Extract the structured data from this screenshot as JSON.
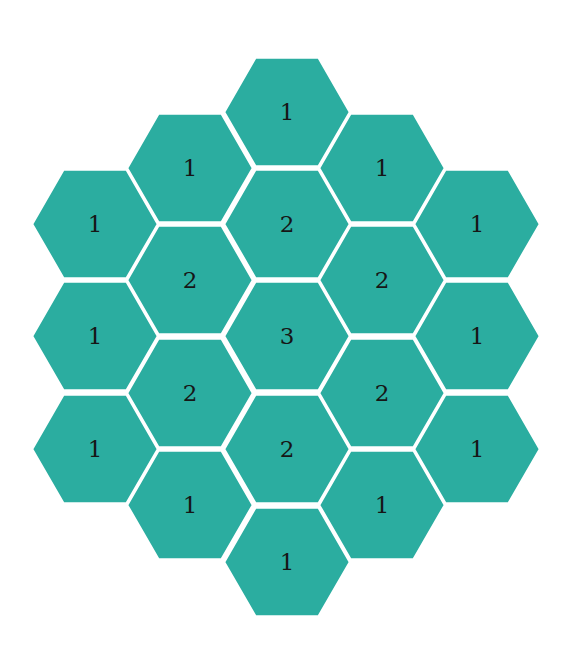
{
  "diagram": {
    "type": "hex-grid",
    "orientation": "flat-top",
    "fill_color": "#2bada0",
    "border_color": "#ffffff",
    "text_color": "#161616",
    "geometry": {
      "radius": 63,
      "col_spacing": 95.5,
      "row_spacing": 112.5
    },
    "columns": [
      {
        "cx": 95,
        "cells": [
          {
            "cy": 224,
            "value": "1"
          },
          {
            "cy": 336,
            "value": "1"
          },
          {
            "cy": 449,
            "value": "1"
          }
        ]
      },
      {
        "cx": 190,
        "cells": [
          {
            "cy": 168,
            "value": "1"
          },
          {
            "cy": 280,
            "value": "2"
          },
          {
            "cy": 393,
            "value": "2"
          },
          {
            "cy": 505,
            "value": "1"
          }
        ]
      },
      {
        "cx": 287,
        "cells": [
          {
            "cy": 112,
            "value": "1"
          },
          {
            "cy": 224,
            "value": "2"
          },
          {
            "cy": 336,
            "value": "3"
          },
          {
            "cy": 449,
            "value": "2"
          },
          {
            "cy": 562,
            "value": "1"
          }
        ]
      },
      {
        "cx": 382,
        "cells": [
          {
            "cy": 168,
            "value": "1"
          },
          {
            "cy": 280,
            "value": "2"
          },
          {
            "cy": 393,
            "value": "2"
          },
          {
            "cy": 505,
            "value": "1"
          }
        ]
      },
      {
        "cx": 477,
        "cells": [
          {
            "cy": 224,
            "value": "1"
          },
          {
            "cy": 336,
            "value": "1"
          },
          {
            "cy": 449,
            "value": "1"
          }
        ]
      }
    ]
  }
}
